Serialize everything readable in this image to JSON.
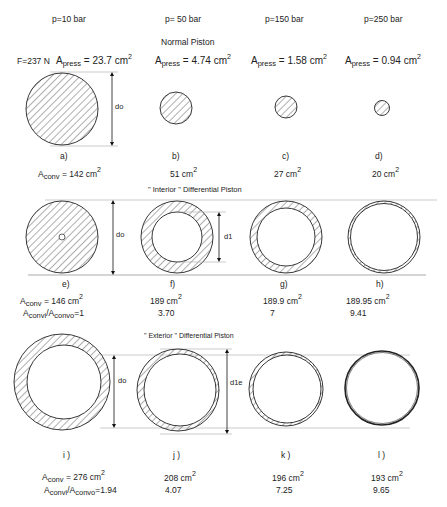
{
  "pressures": [
    "p=10 bar",
    "p= 50 bar",
    "p=150 bar",
    "p=250 bar"
  ],
  "sections": {
    "normal": {
      "title": "Normal Piston",
      "force": "F=237 N",
      "apress_symbol": "A",
      "apress_sub": "press",
      "apress_values": [
        "= 23.7 cm",
        "= 4.74 cm",
        "= 1.58 cm",
        "= 0.94 cm"
      ],
      "dimension_label": "do",
      "labels": [
        "a)",
        "b)",
        "c)",
        "d)"
      ],
      "aconv_symbol": "A",
      "aconv_sub": "conv",
      "aconv_values": [
        "= 142 cm",
        "51 cm",
        "27 cm",
        "20  cm"
      ]
    },
    "interior": {
      "title": "\" Interior \"   Differential Piston",
      "dimension_labels": [
        "do",
        "d1"
      ],
      "labels": [
        "e)",
        "f)",
        "g)",
        "h)"
      ],
      "aconv_values": [
        "= 146 cm",
        "189 cm",
        "189.9 cm",
        "189.95 cm"
      ],
      "ratio_label": "A",
      "ratio_sub1": "convi",
      "ratio_mid": "/A",
      "ratio_sub2": "convo",
      "ratio_values": [
        "=1",
        "3.70",
        "7",
        "9.41"
      ]
    },
    "exterior": {
      "title": "\" Exterior \"   Differential Piston",
      "dimension_labels": [
        "do",
        "d1e"
      ],
      "labels": [
        "i )",
        "j )",
        "k )",
        "l )"
      ],
      "aconv_values": [
        "= 276 cm",
        "208 cm",
        "196 cm",
        "193 cm"
      ],
      "ratio_values": [
        "=1.94",
        "4.07",
        "7.25",
        "9.65"
      ]
    }
  },
  "units_exponent": "2",
  "colors": {
    "stroke": "#222222",
    "guide": "#aaaaaa"
  }
}
